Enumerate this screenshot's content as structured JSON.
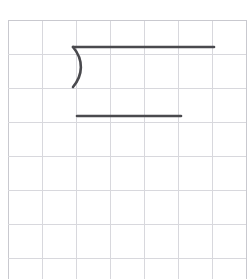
{
  "app": {
    "title": "Handwriting Practice Grid",
    "background_color": "#ffffff"
  },
  "header": {
    "clipped_text": "一二 一二 一",
    "note": "faint characters clipped at top edge"
  },
  "grid": {
    "label": "practice-grid",
    "origin_x": 8,
    "origin_y": 20,
    "cell_size": 34,
    "columns": 7,
    "rows": 8,
    "width": 238,
    "height": 272,
    "line_color": "#d8d8dd",
    "line_color_strong": "#c9c9cf",
    "line_width": 1
  },
  "strokes": {
    "color": "#4a4a4e",
    "width": 2.6,
    "items": [
      {
        "name": "top-horizontal-stroke",
        "kind": "line",
        "x1": 73,
        "y1": 47,
        "x2": 214,
        "y2": 47
      },
      {
        "name": "right-paren-curve-stroke",
        "kind": "curve",
        "start_x": 73,
        "start_y": 47,
        "c1_x": 84,
        "c1_y": 60,
        "c2_x": 83,
        "c2_y": 75,
        "end_x": 73,
        "end_y": 87
      },
      {
        "name": "lower-horizontal-stroke",
        "kind": "line",
        "x1": 77,
        "y1": 116,
        "x2": 181,
        "y2": 116
      }
    ]
  },
  "chart_data": {
    "type": "table",
    "xlabel": "",
    "ylabel": "",
    "categories": [
      "col1",
      "col2",
      "col3",
      "col4",
      "col5",
      "col6",
      "col7"
    ],
    "values": [
      0,
      0,
      0,
      0,
      0,
      0,
      0
    ]
  }
}
